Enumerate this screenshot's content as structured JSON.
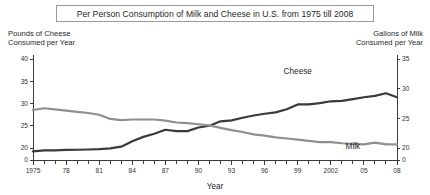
{
  "chart_data": {
    "type": "line",
    "title": "Per Person Consumption of Milk and Cheese in U.S. from 1975 till 2008",
    "xlabel": "Year",
    "ylabel_left": "Pounds of Cheese\nConsumed per Year",
    "ylabel_right": "Gallons of Milk\nConsumed per Year",
    "grid": false,
    "legend": "inline-labels",
    "x": [
      1975,
      1976,
      1977,
      1978,
      1979,
      1980,
      1981,
      1982,
      1983,
      1984,
      1985,
      1986,
      1987,
      1988,
      1989,
      1990,
      1991,
      1992,
      1993,
      1994,
      1995,
      1996,
      1997,
      1998,
      1999,
      2000,
      2001,
      2002,
      2003,
      2004,
      2005,
      2006,
      2007,
      2008
    ],
    "xtick_values": [
      1975,
      1978,
      1981,
      1984,
      1987,
      1990,
      1993,
      1996,
      1999,
      2002,
      2005,
      2008
    ],
    "xtick_labels": [
      "1975",
      "78",
      "81",
      "84",
      "87",
      "90",
      "93",
      "96",
      "99",
      "2002",
      "05",
      "08"
    ],
    "ytick_left": [
      0,
      20,
      25,
      30,
      35,
      40
    ],
    "ytick_left_labels": [
      "0",
      "20",
      "25",
      "30",
      "35",
      "40"
    ],
    "ylim_left": [
      0,
      40
    ],
    "ytick_right": [
      0,
      20,
      25,
      30,
      35
    ],
    "ytick_right_labels": [
      "0",
      "20",
      "25",
      "30",
      "35"
    ],
    "ylim_right": [
      0,
      35
    ],
    "series": [
      {
        "name": "Cheese",
        "axis": "left",
        "unit": "pounds per year",
        "color": "#3a3a3a",
        "label_x": 1999,
        "label_y": 36.6,
        "values": [
          14.3,
          15.9,
          16.2,
          17.0,
          17.1,
          17.5,
          18.1,
          19.4,
          20.3,
          21.5,
          22.5,
          23.2,
          24.1,
          23.8,
          23.8,
          24.6,
          25.0,
          26.0,
          26.2,
          26.8,
          27.3,
          27.7,
          28.0,
          28.7,
          29.8,
          29.8,
          30.1,
          30.5,
          30.6,
          31.0,
          31.4,
          31.7,
          32.3,
          31.4
        ]
      },
      {
        "name": "Milk",
        "axis": "right",
        "unit": "gallons per year",
        "color": "#8f8f8f",
        "label_x": 2004,
        "label_y": 19.1,
        "values": [
          26.4,
          26.7,
          26.5,
          26.3,
          26.1,
          25.9,
          25.6,
          24.9,
          24.7,
          24.8,
          24.8,
          24.8,
          24.6,
          24.3,
          24.2,
          24.0,
          23.8,
          23.4,
          23.0,
          22.7,
          22.3,
          22.1,
          21.8,
          21.6,
          21.4,
          21.2,
          21.0,
          21.0,
          20.8,
          20.7,
          20.6,
          20.9,
          20.6,
          20.6
        ]
      }
    ]
  }
}
